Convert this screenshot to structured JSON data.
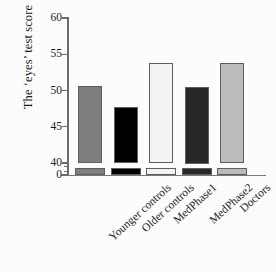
{
  "chart_data": {
    "type": "bar",
    "title": "",
    "xlabel": "",
    "ylabel": "The ‘eyes’ test score",
    "categories": [
      "Younger controls",
      "Older controls",
      "MedPhase1",
      "MedPhase2",
      "Doctors"
    ],
    "values": [
      50.6,
      47.7,
      53.8,
      50.5,
      53.8
    ],
    "bar_colors": [
      "#808080",
      "#000000",
      "#f5f5f5",
      "#282828",
      "#bebebe"
    ],
    "bar_edge_color": "#5f5f5f",
    "ylim": [
      40,
      60
    ],
    "y_axis_break": true,
    "y_break_from": 0,
    "y_break_to": 40,
    "yticks": [
      0,
      40,
      45,
      50,
      55,
      60
    ],
    "ytick_labels": [
      "0",
      "40",
      "45",
      "50",
      "55",
      "60"
    ],
    "grid": false,
    "legend": "none",
    "axis_color": "#6d6d6d"
  },
  "axis": {
    "y_title": "The ‘eyes’ test score",
    "ticks": [
      {
        "label": "60",
        "value": 60
      },
      {
        "label": "55",
        "value": 55
      },
      {
        "label": "50",
        "value": 50
      },
      {
        "label": "45",
        "value": 45
      },
      {
        "label": "40",
        "value": 40
      },
      {
        "label": "0",
        "value": 0
      }
    ]
  },
  "bars": [
    {
      "label": "Younger controls",
      "value": 50.6,
      "color": "#808080"
    },
    {
      "label": "Older controls",
      "value": 47.7,
      "color": "#000000"
    },
    {
      "label": "MedPhase1",
      "value": 53.8,
      "color": "#f5f5f5"
    },
    {
      "label": "MedPhase2",
      "value": 50.5,
      "color": "#282828"
    },
    {
      "label": "Doctors",
      "value": 53.8,
      "color": "#bebebe"
    }
  ]
}
